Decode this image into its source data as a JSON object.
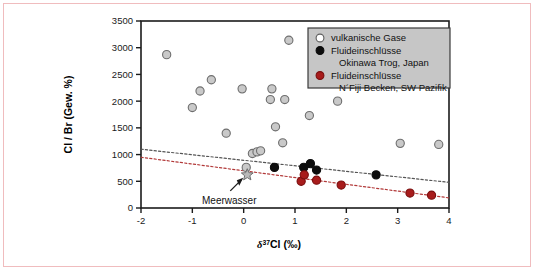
{
  "figure": {
    "background": "#ffffff",
    "border_color": "#f0bcbe"
  },
  "axes": {
    "x": {
      "label_prefix": "δ",
      "label_sup": "37",
      "label_main": "Cl (‰)",
      "label_full": "δ37Cl (‰)",
      "min": -2,
      "max": 4,
      "ticks": [
        -2,
        -1,
        0,
        1,
        2,
        3,
        4
      ],
      "tick_labels": [
        "-2",
        "-1",
        "0",
        "1",
        "2",
        "3",
        "4"
      ]
    },
    "y": {
      "label": "Cl / Br (Gew. %)",
      "min": 0,
      "max": 3500,
      "ticks": [
        0,
        500,
        1000,
        1500,
        2000,
        2500,
        3000,
        3500
      ],
      "tick_labels": [
        "0",
        "500",
        "1000",
        "1500",
        "2000",
        "2500",
        "3000",
        "3500"
      ]
    }
  },
  "legend": {
    "background": "#c6c6c6",
    "border": "#3a3a3a",
    "entries": [
      {
        "marker": "open-gray-circle",
        "color": "#ffffff",
        "line1": "vulkanische Gase",
        "line2": ""
      },
      {
        "marker": "filled-black-circle",
        "color": "#0d0d0d",
        "line1": "Fluideinschlüsse",
        "line2": "Okinawa Trog, Japan"
      },
      {
        "marker": "filled-red-circle",
        "color": "#a81c1c",
        "line1": "Fluideinschlüsse",
        "line2": "N´Fiji Becken, SW Pazifik"
      }
    ]
  },
  "annotations": [
    {
      "name": "seawater",
      "text": "Meerwasser",
      "x": 0.07,
      "y": 620,
      "marker": "gray-star"
    }
  ],
  "chart_data": {
    "type": "scatter",
    "title": "",
    "xlabel": "δ37Cl (‰)",
    "ylabel": "Cl / Br (Gew. %)",
    "xlim": [
      -2,
      4
    ],
    "ylim": [
      0,
      3500
    ],
    "grid": false,
    "legend_position": "top-right",
    "series": [
      {
        "name": "vulkanische Gase",
        "marker": "open-gray-circle",
        "fill": "#c9c9c9",
        "edge": "#6e6e6e",
        "points": [
          {
            "x": -1.5,
            "y": 2870
          },
          {
            "x": -1.0,
            "y": 1880
          },
          {
            "x": -0.85,
            "y": 2190
          },
          {
            "x": -0.63,
            "y": 2400
          },
          {
            "x": -0.34,
            "y": 1400
          },
          {
            "x": -0.03,
            "y": 2230
          },
          {
            "x": 0.05,
            "y": 760
          },
          {
            "x": 0.17,
            "y": 1020
          },
          {
            "x": 0.26,
            "y": 1050
          },
          {
            "x": 0.33,
            "y": 1070
          },
          {
            "x": 0.52,
            "y": 2030
          },
          {
            "x": 0.55,
            "y": 2230
          },
          {
            "x": 0.62,
            "y": 1520
          },
          {
            "x": 0.76,
            "y": 1220
          },
          {
            "x": 0.8,
            "y": 2030
          },
          {
            "x": 0.88,
            "y": 3140
          },
          {
            "x": 1.28,
            "y": 1730
          },
          {
            "x": 1.83,
            "y": 2000
          },
          {
            "x": 3.05,
            "y": 1210
          },
          {
            "x": 3.8,
            "y": 1190
          }
        ]
      },
      {
        "name": "Fluideinschlüsse Okinawa Trog, Japan",
        "marker": "filled-black-circle",
        "fill": "#0d0d0d",
        "edge": "#0d0d0d",
        "points": [
          {
            "x": 0.6,
            "y": 760
          },
          {
            "x": 1.17,
            "y": 760
          },
          {
            "x": 1.3,
            "y": 830
          },
          {
            "x": 1.42,
            "y": 710
          },
          {
            "x": 2.58,
            "y": 620
          }
        ]
      },
      {
        "name": "Fluideinschlüsse N´Fiji Becken, SW Pazifik",
        "marker": "filled-red-circle",
        "fill": "#a81c1c",
        "edge": "#7a1010",
        "points": [
          {
            "x": 1.12,
            "y": 500
          },
          {
            "x": 1.18,
            "y": 620
          },
          {
            "x": 1.42,
            "y": 520
          },
          {
            "x": 1.9,
            "y": 430
          },
          {
            "x": 3.24,
            "y": 280
          },
          {
            "x": 3.66,
            "y": 240
          }
        ]
      }
    ],
    "trend_lines": [
      {
        "name": "upper-trend",
        "color": "#555555",
        "style": "dotted",
        "x0": -2,
        "y0": 1100,
        "x1": 4,
        "y1": 480
      },
      {
        "name": "lower-trend",
        "color": "#b23a3a",
        "style": "dotted",
        "x0": -2,
        "y0": 950,
        "x1": 4,
        "y1": 190
      }
    ]
  }
}
